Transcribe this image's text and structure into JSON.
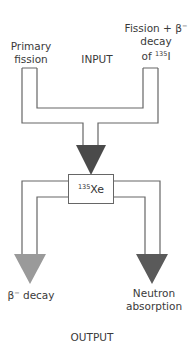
{
  "diagram": {
    "inputs": {
      "left_line1": "Primary",
      "left_line2": "fission",
      "right_line1": "Fission + β",
      "right_line1_sup": "−",
      "right_line2": "decay",
      "right_line3_pre": "of ",
      "right_line3_sup": "135",
      "right_line3_post": "I"
    },
    "input_title": "INPUT",
    "node": {
      "sup": "135",
      "symbol": "Xe"
    },
    "outputs": {
      "left_pre": "β",
      "left_sup": "−",
      "left_post": " decay",
      "right_line1": "Neutron",
      "right_line2": "absorption"
    },
    "output_title": "OUTPUT",
    "colors": {
      "line": "#666666",
      "arrow_input": "#4a4a4a",
      "arrow_beta": "#9a9a9a",
      "arrow_neutron": "#5a5a5a"
    }
  }
}
